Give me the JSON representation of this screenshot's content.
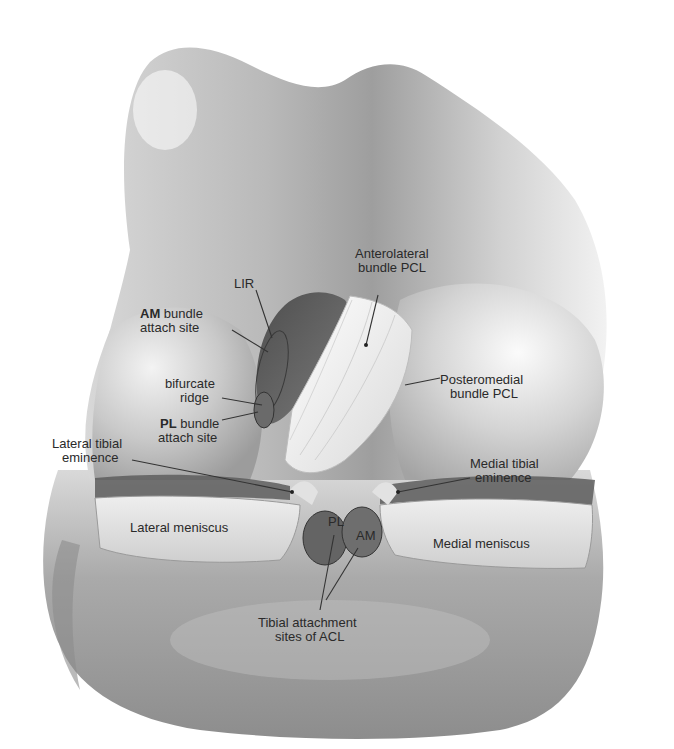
{
  "figure": {
    "colors": {
      "background": "#ffffff",
      "bone_light": "#e9e9e9",
      "bone_mid": "#bdbdbd",
      "bone_dark": "#8a8a8a",
      "notch": "#5e5e5e",
      "footprint": "#6a6a6a",
      "ligament": "#f4f4f4",
      "text": "#2a2a2a"
    },
    "labels": {
      "lir": "LIR",
      "am_site": {
        "bold": "AM",
        "line1_rest": " bundle",
        "line2": "attach site"
      },
      "bifurcate": {
        "line1": "bifurcate",
        "line2": "ridge"
      },
      "pl_site": {
        "bold": "PL",
        "line1_rest": " bundle",
        "line2": "attach site"
      },
      "lateral_eminence": {
        "line1": "Lateral tibial",
        "line2": "eminence"
      },
      "anterolateral": {
        "line1": "Anterolateral",
        "line2": "bundle PCL"
      },
      "posteromedial": {
        "line1": "Posteromedial",
        "line2": "bundle PCL"
      },
      "medial_eminence": {
        "line1": "Medial tibial",
        "line2": "eminence"
      },
      "lateral_meniscus": "Lateral meniscus",
      "medial_meniscus": "Medial meniscus",
      "footprint_pl": "PL",
      "footprint_am": "AM",
      "tibial_acl": {
        "line1": "Tibial attachment",
        "line2": "sites of ACL"
      }
    }
  }
}
